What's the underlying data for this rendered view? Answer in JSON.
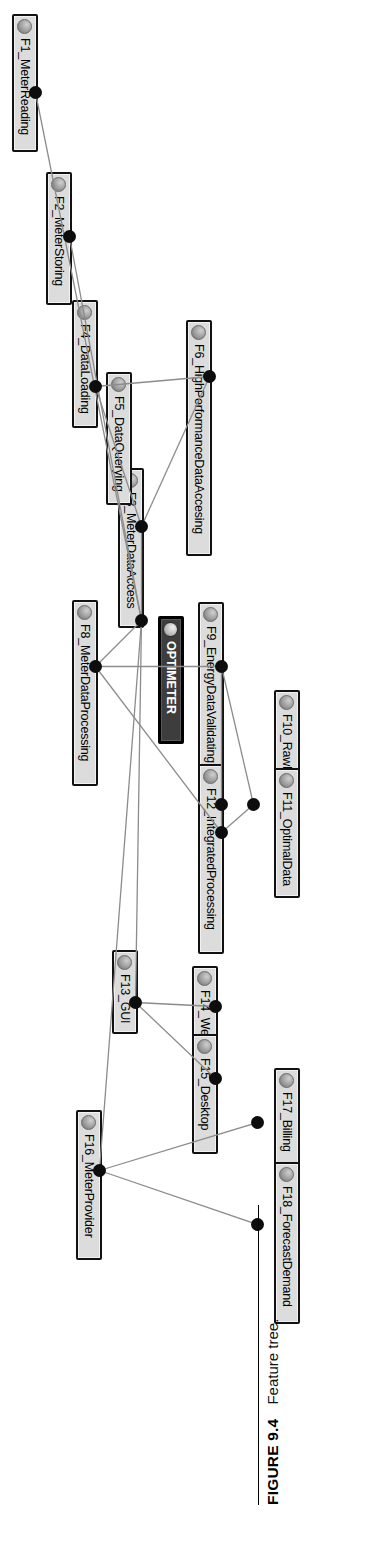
{
  "figure": {
    "label": "FIGURE 9.4",
    "caption": "Feature tree."
  },
  "diagram": {
    "type": "feature-tree",
    "orientation": "rotated-90-clockwise",
    "root": "OPTIMETER",
    "node_fill": "#dcdcdc",
    "root_fill": "#3d3d3d",
    "edge_color": "#8c8c8c",
    "connector_dot_color": "#0d0d0d",
    "nodes": [
      {
        "id": "ROOT",
        "label": "OPTIMETER",
        "x": 616,
        "y": 146,
        "w": 128,
        "root": true
      },
      {
        "id": "F1",
        "label": "F1_MeterReading",
        "x": 14,
        "y": 292,
        "w": 138
      },
      {
        "id": "F2",
        "label": "F2_MeterStoring",
        "x": 172,
        "y": 258,
        "w": 133
      },
      {
        "id": "F3",
        "label": "F3_MeterDataAccess",
        "x": 468,
        "y": 186,
        "w": 160
      },
      {
        "id": "F4",
        "label": "F4_DataLoading",
        "x": 300,
        "y": 232,
        "w": 128
      },
      {
        "id": "F5",
        "label": "F5_DataQuerying",
        "x": 372,
        "y": 198,
        "w": 133
      },
      {
        "id": "F6",
        "label": "F6_HighPerformanceDataAccesing",
        "x": 320,
        "y": 118,
        "w": 236
      },
      {
        "id": "F7",
        "label": "F8_MeterDataProcessing",
        "x": 600,
        "y": 232,
        "w": 186
      },
      {
        "id": "F9",
        "label": "F9_EnergyDataValidating",
        "x": 602,
        "y": 106,
        "w": 186
      },
      {
        "id": "F10",
        "label": "F10_RawData",
        "x": 690,
        "y": 30,
        "w": 112
      },
      {
        "id": "F11",
        "label": "F11_OptimalData",
        "x": 768,
        "y": 30,
        "w": 130
      },
      {
        "id": "F12",
        "label": "F12_IntegratedProcessing",
        "x": 764,
        "y": 106,
        "w": 190
      },
      {
        "id": "F13",
        "label": "F13_GUI",
        "x": 950,
        "y": 192,
        "w": 84
      },
      {
        "id": "F14",
        "label": "F14_Web",
        "x": 966,
        "y": 112,
        "w": 92
      },
      {
        "id": "F15",
        "label": "F15_Desktop",
        "x": 1034,
        "y": 112,
        "w": 120
      },
      {
        "id": "F16",
        "label": "F16_MeterProvider",
        "x": 1110,
        "y": 228,
        "w": 150
      },
      {
        "id": "F17",
        "label": "F17_Billing",
        "x": 1068,
        "y": 30,
        "w": 104
      },
      {
        "id": "F18",
        "label": "F18_ForecastDemand",
        "x": 1162,
        "y": 30,
        "w": 162
      }
    ],
    "connectors": [
      {
        "id": "d-root",
        "x": 614,
        "y": 182
      },
      {
        "id": "d-F1",
        "x": 86,
        "y": 288
      },
      {
        "id": "d-F2",
        "x": 230,
        "y": 254
      },
      {
        "id": "d-F3",
        "x": 520,
        "y": 182
      },
      {
        "id": "d-F4",
        "x": 380,
        "y": 228
      },
      {
        "id": "d-F6",
        "x": 370,
        "y": 114
      },
      {
        "id": "d-F8",
        "x": 660,
        "y": 228
      },
      {
        "id": "d-F9",
        "x": 660,
        "y": 102
      },
      {
        "id": "d-F10",
        "x": 798,
        "y": 70
      },
      {
        "id": "d-F11",
        "x": 798,
        "y": 102
      },
      {
        "id": "d-F12",
        "x": 826,
        "y": 102
      },
      {
        "id": "d-F13",
        "x": 996,
        "y": 188
      },
      {
        "id": "d-F14",
        "x": 1000,
        "y": 108
      },
      {
        "id": "d-F15",
        "x": 1072,
        "y": 108
      },
      {
        "id": "d-F16",
        "x": 1164,
        "y": 224
      },
      {
        "id": "d-F17",
        "x": 1116,
        "y": 66
      },
      {
        "id": "d-F18",
        "x": 1218,
        "y": 66
      }
    ],
    "edges": [
      {
        "from": "d-root",
        "to": "d-F1"
      },
      {
        "from": "d-root",
        "to": "d-F2"
      },
      {
        "from": "d-root",
        "to": "d-F3"
      },
      {
        "from": "d-root",
        "to": "d-F8"
      },
      {
        "from": "d-root",
        "to": "d-F13"
      },
      {
        "from": "d-root",
        "to": "d-F16"
      },
      {
        "from": "d-F3",
        "to": "d-F4"
      },
      {
        "from": "d-F3",
        "to": "d-F6"
      },
      {
        "from": "d-F4",
        "to": "d-F6"
      },
      {
        "from": "d-F8",
        "to": "d-F9"
      },
      {
        "from": "d-F8",
        "to": "d-F12"
      },
      {
        "from": "d-F9",
        "to": "d-F10"
      },
      {
        "from": "d-F9",
        "to": "d-F11"
      },
      {
        "from": "d-F12",
        "to": "d-F10"
      },
      {
        "from": "d-F12",
        "to": "d-F11"
      },
      {
        "from": "d-F13",
        "to": "d-F14"
      },
      {
        "from": "d-F13",
        "to": "d-F15"
      },
      {
        "from": "d-F16",
        "to": "d-F17"
      },
      {
        "from": "d-F16",
        "to": "d-F18"
      }
    ]
  }
}
